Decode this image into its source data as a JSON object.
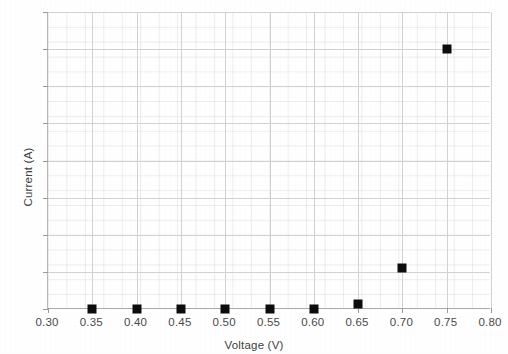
{
  "chart_data": {
    "type": "scatter",
    "title": "",
    "xlabel": "Voltage (V)",
    "ylabel": "Current (A)",
    "xlim": [
      0.3,
      0.8
    ],
    "ylim": [
      0.0,
      4.0
    ],
    "grid": true,
    "legend": "none",
    "marker": "black filled square",
    "x": [
      0.35,
      0.4,
      0.45,
      0.5,
      0.55,
      0.6,
      0.65,
      0.7,
      0.75
    ],
    "y": [
      0.0,
      0.0,
      0.0,
      0.0,
      0.0,
      0.0,
      0.07,
      0.55,
      3.5
    ],
    "xticks": [
      "0.30",
      "0.35",
      "0.40",
      "0.45",
      "0.50",
      "0.55",
      "0.60",
      "0.65",
      "0.70",
      "0.75",
      "0.80"
    ],
    "xtick_values": [
      0.3,
      0.35,
      0.4,
      0.45,
      0.5,
      0.55,
      0.6,
      0.65,
      0.7,
      0.75,
      0.8
    ],
    "yticks": [
      "0.0",
      "0.5",
      "1.0",
      "1.5",
      "2.0",
      "2.5",
      "3.0",
      "3.5",
      "4.0"
    ],
    "ytick_values": [
      0.0,
      0.5,
      1.0,
      1.5,
      2.0,
      2.5,
      3.0,
      3.5,
      4.0
    ],
    "series": [
      {
        "name": "Current vs Voltage",
        "points": [
          {
            "x": 0.35,
            "y": 0.0
          },
          {
            "x": 0.4,
            "y": 0.0
          },
          {
            "x": 0.45,
            "y": 0.0
          },
          {
            "x": 0.5,
            "y": 0.0
          },
          {
            "x": 0.55,
            "y": 0.0
          },
          {
            "x": 0.6,
            "y": 0.0
          },
          {
            "x": 0.65,
            "y": 0.07
          },
          {
            "x": 0.7,
            "y": 0.55
          },
          {
            "x": 0.75,
            "y": 3.5
          }
        ]
      }
    ]
  },
  "colors": {
    "marker": "#0d0d0d",
    "gridline": "#d2d2d2",
    "minor_gridline": "#e9e9e9",
    "axis": "#a9a9a9",
    "tick_text": "#4a4a4a",
    "axis_title": "#404040",
    "background": "#ffffff"
  }
}
